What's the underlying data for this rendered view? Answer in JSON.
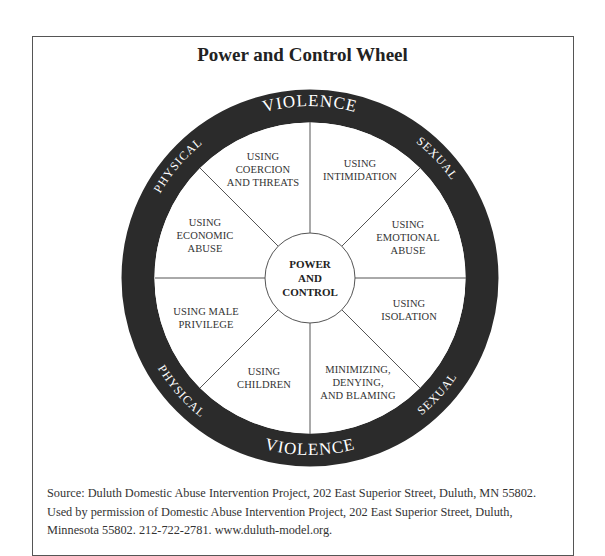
{
  "title": "Power and Control Wheel",
  "rim": {
    "top": {
      "left": "PHYSICAL",
      "middle": "VIOLENCE",
      "right": "SEXUAL"
    },
    "bottom": {
      "left": "PHYSICAL",
      "middle": "VIOLENCE",
      "right": "SEXUAL"
    }
  },
  "center": {
    "line1": "POWER",
    "line2": "AND",
    "line3": "CONTROL"
  },
  "segments": [
    {
      "position": "top-left",
      "lines": [
        "USING",
        "COERCION",
        "AND THREATS"
      ]
    },
    {
      "position": "top-right",
      "lines": [
        "USING",
        "INTIMIDATION"
      ]
    },
    {
      "position": "right-upper",
      "lines": [
        "USING",
        "EMOTIONAL",
        "ABUSE"
      ]
    },
    {
      "position": "right-lower",
      "lines": [
        "USING",
        "ISOLATION"
      ]
    },
    {
      "position": "bottom-right",
      "lines": [
        "MINIMIZING,",
        "DENYING,",
        "AND BLAMING"
      ]
    },
    {
      "position": "bottom-left",
      "lines": [
        "USING",
        "CHILDREN"
      ]
    },
    {
      "position": "left-lower",
      "lines": [
        "USING MALE",
        "PRIVILEGE"
      ]
    },
    {
      "position": "left-upper",
      "lines": [
        "USING",
        "ECONOMIC",
        "ABUSE"
      ]
    }
  ],
  "source": {
    "line1": "Source: Duluth Domestic Abuse Intervention Project, 202 East Superior Street, Duluth, MN 55802.",
    "line2": "Used by permission of Domestic Abuse Intervention Project, 202 East Superior Street, Duluth,",
    "line3": "Minnesota 55802. 212-722-2781. www.duluth-model.org."
  },
  "colors": {
    "rim": "#2b2b2b",
    "lines": "#555555",
    "text": "#333333"
  }
}
